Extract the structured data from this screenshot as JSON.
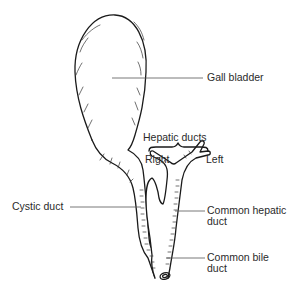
{
  "diagram": {
    "labels": {
      "gall_bladder": "Gall bladder",
      "hepatic_ducts": "Hepatic ducts",
      "right": "Right",
      "left": "Left",
      "cystic_duct": "Cystic duct",
      "common_hepatic_duct_line1": "Common hepatic",
      "common_hepatic_duct_line2": "duct",
      "common_bile_duct_line1": "Common bile",
      "common_bile_duct_line2": "duct"
    },
    "colors": {
      "line": "#1a1a1a",
      "text": "#2a2a2a",
      "background": "#ffffff"
    }
  }
}
